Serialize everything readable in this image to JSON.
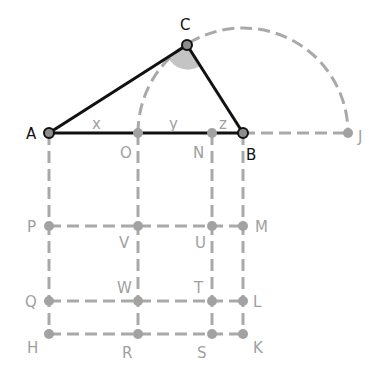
{
  "figure": {
    "type": "geometry-diagram",
    "colors": {
      "solid_line": "#111111",
      "dashed_line": "#a9a9a9",
      "angle_fill": "#c4c4c4",
      "label_dark": "#111111",
      "label_gray": "#a0a0a0"
    },
    "points": {
      "A": {
        "label": "A",
        "x": 49,
        "y": 133
      },
      "O": {
        "label": "O",
        "x": 138,
        "y": 133
      },
      "N": {
        "label": "N",
        "x": 212,
        "y": 133
      },
      "B": {
        "label": "B",
        "x": 243,
        "y": 133
      },
      "J": {
        "label": "J",
        "x": 348,
        "y": 133
      },
      "C": {
        "label": "C",
        "x": 187,
        "y": 45
      },
      "P": {
        "label": "P",
        "x": 49,
        "y": 226
      },
      "V": {
        "label": "V",
        "x": 138,
        "y": 226
      },
      "U": {
        "label": "U",
        "x": 212,
        "y": 226
      },
      "M": {
        "label": "M",
        "x": 243,
        "y": 226
      },
      "Q": {
        "label": "Q",
        "x": 49,
        "y": 301
      },
      "W": {
        "label": "W",
        "x": 138,
        "y": 301
      },
      "T": {
        "label": "T",
        "x": 212,
        "y": 301
      },
      "L": {
        "label": "L",
        "x": 243,
        "y": 301
      },
      "H": {
        "label": "H",
        "x": 49,
        "y": 334
      },
      "R": {
        "label": "R",
        "x": 138,
        "y": 334
      },
      "S": {
        "label": "S",
        "x": 212,
        "y": 334
      },
      "K": {
        "label": "K",
        "x": 243,
        "y": 334
      }
    },
    "segment_labels": {
      "x": "x",
      "y": "y",
      "z": "z"
    },
    "arc": {
      "center": "B",
      "radius": 105,
      "from": "O",
      "to": "J"
    }
  }
}
